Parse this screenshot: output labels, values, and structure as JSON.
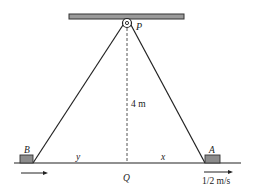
{
  "diagram": {
    "type": "pulley-rope-blocks",
    "labels": {
      "pulley": "P",
      "height": "4 m",
      "foot": "Q",
      "left_block": "B",
      "right_block": "A",
      "left_distance": "y",
      "right_distance": "x",
      "speed": "1/2 m/s"
    },
    "colors": {
      "line": "#222222",
      "beam_fill": "#9a9a9a",
      "block_fill": "#8c8c8c",
      "dashed": "#555555",
      "background": "#ffffff"
    }
  }
}
